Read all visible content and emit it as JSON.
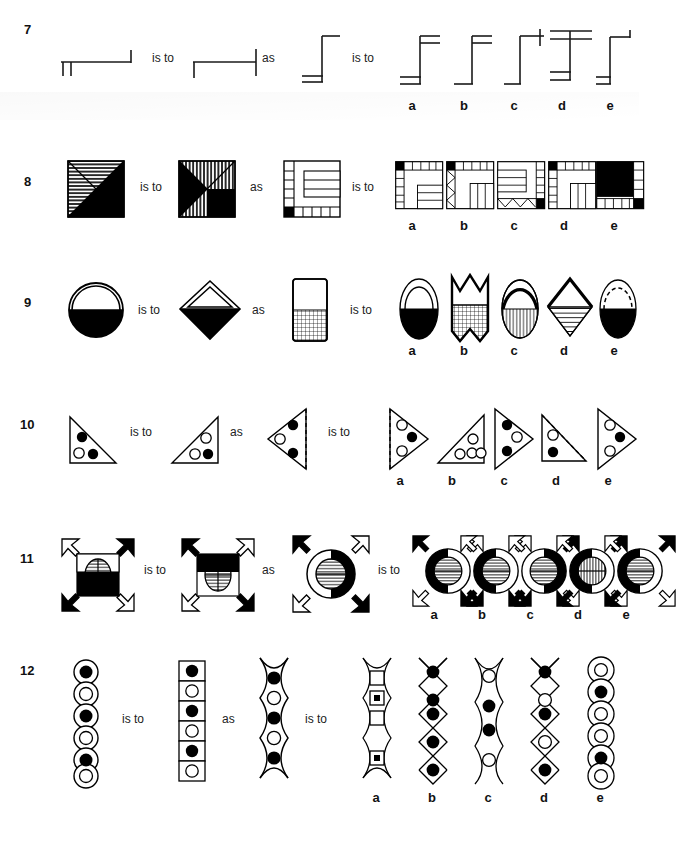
{
  "page": {
    "kind": "non-verbal-reasoning-analogy-test",
    "option_labels": [
      "a",
      "b",
      "c",
      "d",
      "e"
    ],
    "relation_label_1": "is to",
    "relation_label_2": "as",
    "relation_label_3": "is to",
    "ink_color": "#000000",
    "paper_color": "#ffffff"
  },
  "questions": [
    {
      "number": "7",
      "theme": "line-and-tick bracket figures",
      "stimulus": [
        {
          "id": "q7-s1",
          "desc": "horizontal line with two short down ticks at left end and one up tick at right end"
        },
        {
          "id": "q7-s2",
          "desc": "horizontal line with one down tick at left end and a full crossing tick at right end"
        },
        {
          "id": "q7-s3",
          "desc": "tall vertical line, single horizontal bar top-right, double horizontal bars bottom-left"
        }
      ],
      "options": [
        {
          "label": "a",
          "desc": "vertical line, double bars top-right, double bars bottom-left"
        },
        {
          "label": "b",
          "desc": "vertical line, double bars top-right, single bar bottom-left"
        },
        {
          "label": "c",
          "desc": "vertical line, single bar top-right with crossing tick, single bar bottom-left"
        },
        {
          "label": "d",
          "desc": "vertical line, double bars at top crossing, double bars at bottom-left"
        },
        {
          "label": "e",
          "desc": "vertical line, single bar top-right with up tick, double bars bottom-left"
        }
      ]
    },
    {
      "number": "8",
      "theme": "square divided into hatched and black regions",
      "stimulus": [
        {
          "id": "q8-s1",
          "desc": "square with both diagonals, horizontal hatching, black right and bottom triangles"
        },
        {
          "id": "q8-s2",
          "desc": "square with both diagonals, vertical hatching, black left and bottom-right triangles"
        },
        {
          "id": "q8-s3",
          "desc": "square with nested border strips and black corner cell at bottom-left"
        }
      ],
      "options": [
        {
          "label": "a",
          "desc": "square with left and top strips, inner horizontal strips, black top-left cell"
        },
        {
          "label": "b",
          "desc": "square with zigzag left strip, inner vertical strips, black top-left cell"
        },
        {
          "label": "c",
          "desc": "square with right strip, inner horizontal strips, zigzag bottom strip, black bottom-right cell"
        },
        {
          "label": "d",
          "desc": "square with left and top strips, inner vertical strips, black top-left cell"
        },
        {
          "label": "e",
          "desc": "square with large black top-left block, bottom strip, black bottom-right cell"
        }
      ]
    },
    {
      "number": "9",
      "theme": "rounded outline shapes, half filled",
      "stimulus": [
        {
          "id": "q9-s1",
          "desc": "circle with inner arc, bottom half solid black"
        },
        {
          "id": "q9-s2",
          "desc": "diamond with inner triangle outline, bottom half solid black"
        },
        {
          "id": "q9-s3",
          "desc": "rounded rectangle, top half white, bottom half fine grid hatching"
        }
      ],
      "options": [
        {
          "label": "a",
          "desc": "ellipse with inner arch outline, bottom half solid black"
        },
        {
          "label": "b",
          "desc": "notched banner shape, bottom half grid hatching"
        },
        {
          "label": "c",
          "desc": "ellipse with thick top arc, bottom half vertical hatching"
        },
        {
          "label": "d",
          "desc": "diamond with thick top edges, bottom half horizontal hatching"
        },
        {
          "label": "e",
          "desc": "ellipse with dashed inner arc, bottom half solid black"
        }
      ]
    },
    {
      "number": "10",
      "theme": "right triangles containing black and white dots",
      "stimulus": [
        {
          "id": "q10-s1",
          "desc": "right triangle, vertical left edge, dots: black top, white and black bottom"
        },
        {
          "id": "q10-s2",
          "desc": "right triangle, vertical right edge, dots: white top, white and black bottom"
        },
        {
          "id": "q10-s3",
          "desc": "left-pointing triangle with dashed right edge, dots: black top, white left, black bottom"
        }
      ],
      "options": [
        {
          "label": "a",
          "desc": "right-pointing triangle with dashed left edge, dots: white top, black middle, white bottom"
        },
        {
          "label": "b",
          "desc": "right triangle, vertical right edge, four white dots"
        },
        {
          "label": "c",
          "desc": "right-pointing triangle, solid left edge, dots: black top, white middle, black bottom"
        },
        {
          "label": "d",
          "desc": "right triangle with dashed hypotenuse, dots: white top, black bottom"
        },
        {
          "label": "e",
          "desc": "right-pointing triangle, dots: white top, black middle, white bottom"
        }
      ]
    },
    {
      "number": "11",
      "theme": "four diagonal arrows around a hatched core",
      "stimulus": [
        {
          "id": "q11-s1",
          "desc": "square black surround with hatched circle, arrows: white, black, black, white"
        },
        {
          "id": "q11-s2",
          "desc": "square with black top band and hatched circle, arrows: black, white, white, black"
        },
        {
          "id": "q11-s3",
          "desc": "ring with black right half and hatched inner circle, arrows: black, white, white, black"
        }
      ],
      "options": [
        {
          "label": "a",
          "desc": "ring with black left half, hatched inner circle, arrows: black, white, white, black"
        },
        {
          "label": "b",
          "desc": "ring with black left half, hatched inner circle, arrows: white, white, black, black"
        },
        {
          "label": "c",
          "desc": "ring with black right half, hatched inner circle, arrows: white, black, black, white"
        },
        {
          "label": "d",
          "desc": "ring with black left half, hatched inner circle, arrows: white, black, black, white"
        },
        {
          "label": "e",
          "desc": "ring with black left half, hatched inner circle, arrows: white, black, black, white"
        }
      ]
    },
    {
      "number": "12",
      "theme": "vertical chains of enclosures containing dots",
      "stimulus": [
        {
          "id": "q12-s1",
          "desc": "column of six touching circles with dots: black, white, black, white, black, white"
        },
        {
          "id": "q12-s2",
          "desc": "column of six squares with dots: black, white, black, white, black, white"
        },
        {
          "id": "q12-s3",
          "desc": "chain of five lens shapes with dots: black, white, black, white, black"
        }
      ],
      "options": [
        {
          "label": "a",
          "desc": "chain of four lens shapes containing squares: open, dotted, open, dotted"
        },
        {
          "label": "b",
          "desc": "chain of five diamonds, all black dots"
        },
        {
          "label": "c",
          "desc": "chain of five lenses with dots: white, black, black, white"
        },
        {
          "label": "d",
          "desc": "chain of five diamonds with dots: black, white, black, white, black"
        },
        {
          "label": "e",
          "desc": "chain of six circles with dots: white, black, white, white, black, white"
        }
      ]
    }
  ]
}
